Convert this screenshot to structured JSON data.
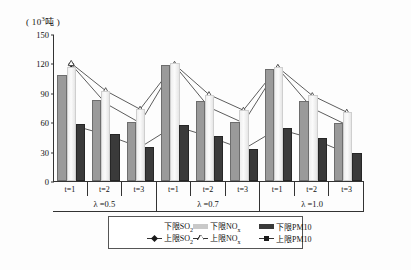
{
  "axis": {
    "unit_caption": "( 10³吨 )",
    "y_ticks": [
      0,
      30,
      60,
      90,
      120,
      150
    ],
    "y_min": 0,
    "y_max": 150
  },
  "x_groups": [
    {
      "label": "λ =0.5",
      "times": [
        "t=1",
        "t=2",
        "t=3"
      ]
    },
    {
      "label": "λ =0.7",
      "times": [
        "t=1",
        "t=2",
        "t=3"
      ]
    },
    {
      "label": "λ =1.0",
      "times": [
        "t=1",
        "t=2",
        "t=3"
      ]
    }
  ],
  "legend": {
    "row1": [
      {
        "key": "lower_so2",
        "label": "下限SO",
        "sub": "2",
        "marker": "bar-gray"
      },
      {
        "key": "lower_nox",
        "label": "下限NO",
        "sub": "x",
        "marker": "bar-light"
      },
      {
        "key": "lower_pm10",
        "label": "下限PM10",
        "sub": "",
        "marker": "bar-dark"
      }
    ],
    "row2": [
      {
        "key": "upper_so2",
        "label": "上限SO",
        "sub": "2",
        "marker": "line-diamond"
      },
      {
        "key": "upper_nox",
        "label": "上限NO",
        "sub": "x",
        "marker": "line-triangle"
      },
      {
        "key": "upper_pm10",
        "label": "上限PM10",
        "sub": "",
        "marker": "line-square"
      }
    ]
  },
  "chart_data": {
    "type": "bar",
    "title": "",
    "xlabel": "",
    "ylabel": "( 10³吨 )",
    "ylim": [
      0,
      150
    ],
    "yticks": [
      0,
      30,
      60,
      90,
      120,
      150
    ],
    "grid": false,
    "legend_position": "bottom",
    "categories": [
      "λ=0.5 t=1",
      "λ=0.5 t=2",
      "λ=0.5 t=3",
      "λ=0.7 t=1",
      "λ=0.7 t=2",
      "λ=0.7 t=3",
      "λ=1.0 t=1",
      "λ=1.0 t=2",
      "λ=1.0 t=3"
    ],
    "series": [
      {
        "name": "下限SO2",
        "type": "bar",
        "values": [
          108,
          83,
          60,
          118,
          82,
          60,
          114,
          82,
          59
        ]
      },
      {
        "name": "下限NOx",
        "type": "bar",
        "values": [
          116,
          92,
          73,
          120,
          88,
          72,
          116,
          88,
          70
        ]
      },
      {
        "name": "下限PM10",
        "type": "bar",
        "values": [
          58,
          48,
          35,
          57,
          46,
          33,
          54,
          44,
          29
        ]
      },
      {
        "name": "上限SO2",
        "type": "line",
        "values": [
          120,
          80,
          60,
          119,
          76,
          60,
          116,
          75,
          58
        ]
      },
      {
        "name": "上限NOx",
        "type": "line",
        "values": [
          121,
          93,
          74,
          120,
          89,
          73,
          117,
          88,
          71
        ]
      },
      {
        "name": "上限PM10",
        "type": "line",
        "values": [
          58,
          48,
          35,
          57,
          46,
          33,
          54,
          44,
          29
        ]
      }
    ]
  }
}
